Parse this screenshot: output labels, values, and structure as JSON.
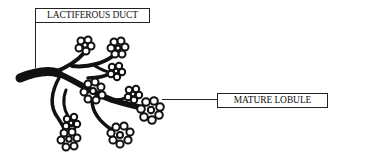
{
  "diagram": {
    "labels": {
      "duct": "LACTIFEROUS DUCT",
      "lobule": "MATURE LOBULE"
    },
    "colors": {
      "ink": "#111111",
      "background": "#ffffff"
    },
    "lobules": [
      {
        "cx": 85,
        "cy": 45,
        "r": 9
      },
      {
        "cx": 118,
        "cy": 48,
        "r": 10
      },
      {
        "cx": 116,
        "cy": 71,
        "r": 8
      },
      {
        "cx": 93,
        "cy": 92,
        "r": 11
      },
      {
        "cx": 133,
        "cy": 94,
        "r": 8
      },
      {
        "cx": 151,
        "cy": 110,
        "r": 11
      },
      {
        "cx": 71,
        "cy": 123,
        "r": 8
      },
      {
        "cx": 69,
        "cy": 139,
        "r": 10
      },
      {
        "cx": 121,
        "cy": 135,
        "r": 11
      }
    ]
  }
}
